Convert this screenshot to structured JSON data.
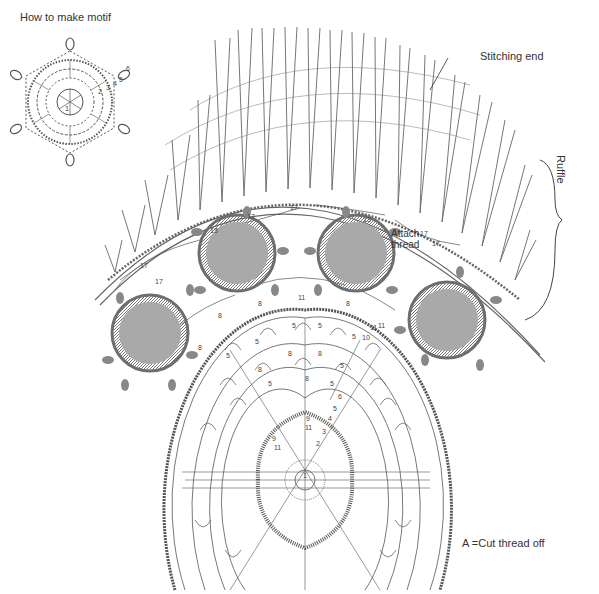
{
  "diagram": {
    "title": "How to make motif",
    "labels": {
      "stitching_end": "Stitching end",
      "ruffle": "Ruffle",
      "attach_thread_line1": "Attach",
      "attach_thread_line2": "thread",
      "legend": "A =Cut thread off"
    },
    "chain_counts": {
      "ruffle_joins": [
        "17",
        "13",
        "17",
        "17",
        "13",
        "17",
        "17",
        "17"
      ],
      "motif_joins": [
        "8",
        "8",
        "11",
        "8",
        "8",
        "11"
      ],
      "doily_rows": [
        "5",
        "5",
        "5",
        "5",
        "5",
        "5",
        "8",
        "8",
        "8",
        "5",
        "5",
        "8",
        "9",
        "11",
        "9",
        "11"
      ]
    },
    "motif_row_numbers": [
      "1",
      "2",
      "3",
      "4",
      "5",
      "6"
    ],
    "doily_row_numbers": [
      "1",
      "2",
      "3",
      "4",
      "5",
      "6",
      "10",
      "11"
    ],
    "motifs_count": 4,
    "colors": {
      "line": "#555555",
      "motif_fill": "#a9a9a9",
      "motif_border": "#6e6e6e",
      "background": "#ffffff"
    }
  }
}
